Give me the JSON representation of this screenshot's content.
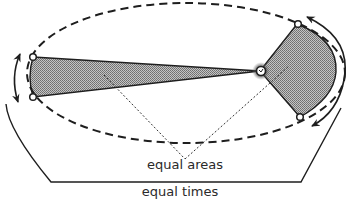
{
  "diagram": {
    "labels": {
      "equal_areas": "equal areas",
      "equal_times": "equal times"
    },
    "elements": {
      "orbit": "dashed elliptical orbit",
      "sun": "sun at focus",
      "sector_aphelion": "narrow shaded sector near aphelion (left)",
      "sector_perihelion": "wide shaded sector near perihelion (right)",
      "planet_positions": 4,
      "arrows": [
        "left double-headed arc arrow",
        "right double-headed arc arrow"
      ]
    },
    "colors": {
      "line": "#1e1e1e",
      "shade": "#9a9a9a",
      "background": "#ffffff"
    }
  }
}
